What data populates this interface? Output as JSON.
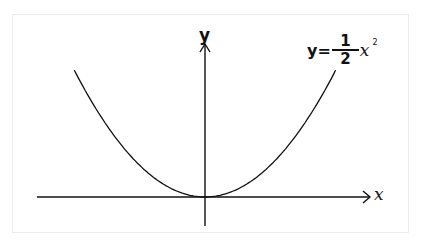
{
  "chart_data": {
    "type": "line",
    "title": "",
    "function": "y = 1/2 x^2",
    "equation_label": {
      "lhs": "y=",
      "numerator": "1",
      "denominator": "2",
      "variable": "x",
      "exponent": "2"
    },
    "xlabel": "x",
    "ylabel": "y",
    "grid": false,
    "ticks": false,
    "legend": "none",
    "x": [
      -6.5,
      -5,
      -4,
      -3,
      -2,
      -1,
      0,
      1,
      2,
      3,
      4,
      5,
      6.5
    ],
    "y": [
      21.1,
      12.5,
      8,
      4.5,
      2,
      0.5,
      0,
      0.5,
      2,
      4.5,
      8,
      12.5,
      21.1
    ],
    "vertex": [
      0,
      0
    ],
    "colors": {
      "curve": "#111111",
      "axes": "#111111",
      "background": "#ffffff"
    }
  },
  "axes": {
    "x_label": "x",
    "y_label": "y"
  }
}
